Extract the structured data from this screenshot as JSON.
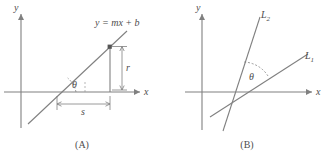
{
  "figure": {
    "width": 329,
    "height": 163,
    "background": "#ffffff",
    "stroke_color": "#808080",
    "text_color": "#4d4d4d"
  },
  "panel_a": {
    "caption": "(A)",
    "axis_y_label": "y",
    "axis_x_label": "x",
    "line_equation": "y = mx + b",
    "angle_label": "θ",
    "rise_label": "r",
    "run_label": "s"
  },
  "panel_b": {
    "caption": "(B)",
    "axis_y_label": "y",
    "axis_x_label": "x",
    "line1_label": "L",
    "line1_subscript": "1",
    "line2_label": "L",
    "line2_subscript": "2",
    "angle_label": "θ"
  }
}
